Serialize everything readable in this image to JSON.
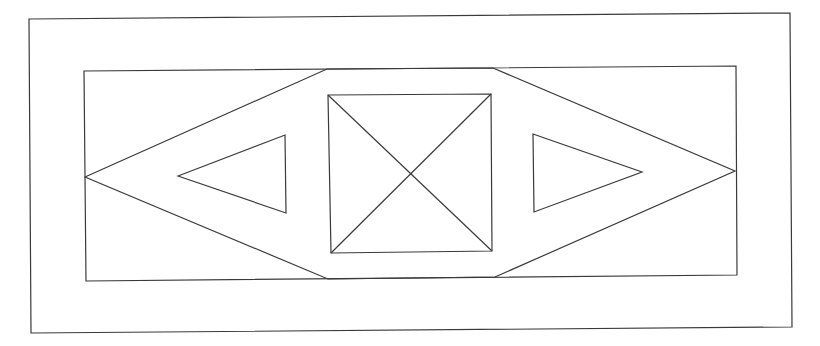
{
  "diagram": {
    "width": 820,
    "height": 346,
    "stroke_color": "#3a3a3a",
    "background": "#ffffff",
    "outer_frame": [
      [
        29,
        19
      ],
      [
        790,
        13
      ],
      [
        792,
        327
      ],
      [
        31,
        333
      ]
    ],
    "inner_frame": [
      [
        84,
        71
      ],
      [
        736,
        66
      ],
      [
        737,
        275
      ],
      [
        86,
        281
      ]
    ],
    "hexagon": [
      [
        85,
        177
      ],
      [
        327,
        69
      ],
      [
        493,
        68
      ],
      [
        735,
        171
      ],
      [
        495,
        277
      ],
      [
        328,
        279
      ]
    ],
    "center_square": [
      [
        328,
        95
      ],
      [
        491,
        94
      ],
      [
        492,
        251
      ],
      [
        331,
        253
      ]
    ],
    "square_diagonals": [
      [
        [
          328,
          95
        ],
        [
          492,
          251
        ]
      ],
      [
        [
          491,
          94
        ],
        [
          331,
          253
        ]
      ]
    ],
    "left_triangle": [
      [
        178,
        176
      ],
      [
        285,
        135
      ],
      [
        286,
        213
      ]
    ],
    "right_triangle": [
      [
        533,
        134
      ],
      [
        642,
        172
      ],
      [
        534,
        212
      ]
    ]
  }
}
